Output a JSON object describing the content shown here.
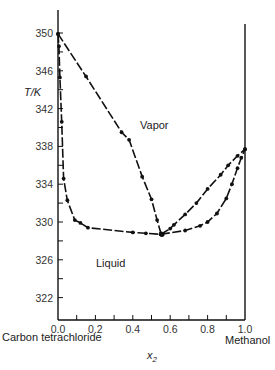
{
  "chart_data": {
    "type": "line",
    "title": "",
    "xlabel": "x2",
    "ylabel": "T/K",
    "xlim": [
      0.0,
      1.0
    ],
    "ylim": [
      320,
      352
    ],
    "x_ticks": [
      "0.0",
      "0.2",
      "0.4",
      "0.6",
      "0.8",
      "1.0"
    ],
    "y_ticks": [
      "322",
      "326",
      "330",
      "334",
      "338",
      "342",
      "346",
      "350"
    ],
    "grid": false,
    "legend": null,
    "annotations": {
      "vapor": "Vapor",
      "liquid": "Liquid",
      "left_component": "Carbon tetrachloride",
      "right_component": "Methanol"
    },
    "series": [
      {
        "name": "CCl4-rich vapor (dew) curve",
        "points": [
          [
            0.0,
            349.9
          ],
          [
            0.15,
            345.4
          ],
          [
            0.34,
            339.5
          ],
          [
            0.38,
            338.7
          ],
          [
            0.45,
            334.8
          ],
          [
            0.5,
            332.4
          ],
          [
            0.53,
            330.2
          ],
          [
            0.55,
            328.8
          ]
        ]
      },
      {
        "name": "CCl4-rich liquid (bubble) curve",
        "points": [
          [
            0.0,
            349.9
          ],
          [
            0.005,
            348.6
          ],
          [
            0.01,
            345.3
          ],
          [
            0.02,
            340.6
          ],
          [
            0.03,
            334.6
          ],
          [
            0.05,
            332.3
          ],
          [
            0.09,
            330.2
          ],
          [
            0.12,
            329.9
          ],
          [
            0.16,
            329.4
          ],
          [
            0.4,
            328.9
          ],
          [
            0.47,
            328.8
          ],
          [
            0.55,
            328.7
          ]
        ]
      },
      {
        "name": "Methanol-rich vapor (dew) curve",
        "points": [
          [
            0.55,
            328.7
          ],
          [
            0.6,
            329.3
          ],
          [
            0.62,
            329.7
          ],
          [
            0.68,
            330.8
          ],
          [
            0.74,
            332.0
          ],
          [
            0.8,
            333.5
          ],
          [
            0.87,
            335.0
          ],
          [
            0.91,
            336.0
          ],
          [
            0.96,
            337.0
          ],
          [
            1.0,
            337.7
          ]
        ]
      },
      {
        "name": "Methanol-rich liquid (bubble) curve",
        "points": [
          [
            0.55,
            328.7
          ],
          [
            0.68,
            329.1
          ],
          [
            0.76,
            329.6
          ],
          [
            0.8,
            330.0
          ],
          [
            0.85,
            330.9
          ],
          [
            0.9,
            332.5
          ],
          [
            0.93,
            334.0
          ],
          [
            0.96,
            335.7
          ],
          [
            0.98,
            336.8
          ],
          [
            1.0,
            337.7
          ]
        ]
      }
    ],
    "azeotrope": {
      "x2": 0.556,
      "T": 328.7
    }
  }
}
